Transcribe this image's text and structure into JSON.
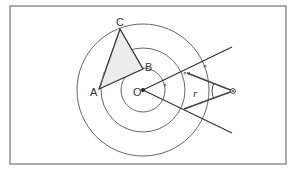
{
  "figure": {
    "frame": {
      "x": 10,
      "y": 6,
      "width": 276,
      "height": 158,
      "stroke": "#777777"
    },
    "center": {
      "label": "O",
      "x": 143,
      "y": 90
    },
    "circles": [
      {
        "r": 22
      },
      {
        "r": 42
      },
      {
        "r": 66
      }
    ],
    "triangle": {
      "fill": "#ececec",
      "vertices": [
        {
          "label": "A",
          "x": 99,
          "y": 89
        },
        {
          "label": "B",
          "x": 143,
          "y": 69
        },
        {
          "label": "C",
          "x": 120,
          "y": 29
        }
      ]
    },
    "rays": [
      {
        "x2": 232,
        "y2": 47
      },
      {
        "x2": 232,
        "y2": 133
      }
    ],
    "compass": {
      "pivot": {
        "x": 233,
        "y": 91
      },
      "arm_upper": {
        "x": 187,
        "y": 73
      },
      "arm_lower": {
        "x": 184,
        "y": 109
      },
      "radius_label": "r"
    },
    "colors": {
      "line": "#333333",
      "circle": "#666666"
    }
  }
}
